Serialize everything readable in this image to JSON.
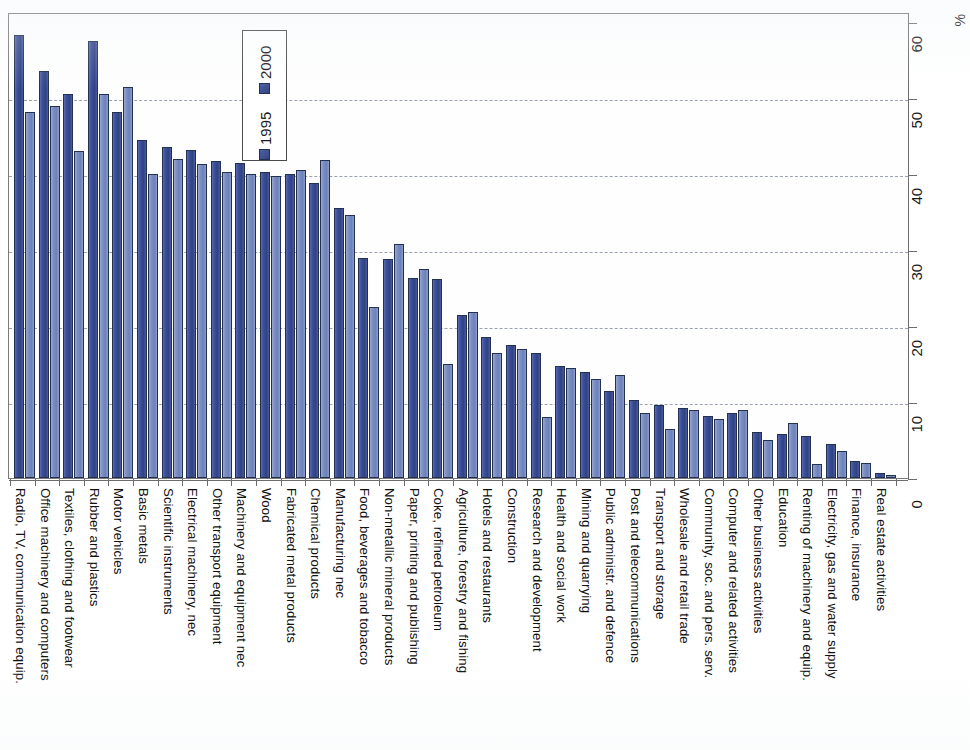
{
  "chart_data": {
    "type": "bar",
    "title": "",
    "xlabel": "",
    "ylabel": "%",
    "ylim": [
      0,
      60
    ],
    "ytick_labels": [
      "0",
      "10",
      "20",
      "30",
      "40",
      "50",
      "60"
    ],
    "ytick_values": [
      0,
      10,
      20,
      30,
      40,
      50,
      60
    ],
    "grid": true,
    "grid_axis": "y",
    "legend_position": "upper-left-inside",
    "orientation": "vertical-bars-rotated-page",
    "colors": {
      "series_1995": "#3b4f9e",
      "series_2000": "#7b8fc4",
      "bar_border": "#23304f",
      "axis": "#6d6d6d",
      "gridline": "#9aa3ae",
      "background": "#ffffff"
    },
    "categories": [
      "Radio, TV, communication equip.",
      "Office machinery and computers",
      "Textiles, clothing and footwear",
      "Rubber and plastics",
      "Motor vehicles",
      "Basic metals",
      "Scientific instruments",
      "Electrical machinery, nec",
      "Other transport equipment",
      "Machinery and equipment nec",
      "Wood",
      "Fabricated metal products",
      "Chemical products",
      "Manufacturing nec",
      "Food, beverages and tobacco",
      "Non-metallic mineral products",
      "Paper, printing and publishing",
      "Coke, refined petroleum",
      "Agriculture, forestry and fishing",
      "Hotels and restaurants",
      "Construction",
      "Research and development",
      "Health and social work",
      "Mining and quarrying",
      "Public administr. and defence",
      "Post and telecommunications",
      "Transport and storage",
      "Wholesale and retail trade",
      "Community, soc. and pers. serv.",
      "Computer and related activities",
      "Other business activities",
      "Education",
      "Renting of machinery and equip.",
      "Electricity, gas and water supply",
      "Finance, insurance",
      "Real estate activities"
    ],
    "series": [
      {
        "name": "1995",
        "color": "#3b4f9e",
        "values": [
          58.3,
          53.5,
          50.5,
          57.5,
          48.2,
          44.5,
          43.5,
          43.2,
          41.7,
          41.5,
          40.2,
          40.0,
          38.8,
          35.5,
          29.0,
          28.8,
          26.3,
          26.2,
          21.5,
          18.5,
          17.5,
          16.5,
          14.8,
          14.0,
          11.5,
          10.2,
          9.6,
          9.2,
          8.2,
          8.5,
          6.0,
          5.8,
          5.5,
          4.5,
          2.2,
          0.6
        ]
      },
      {
        "name": "2000",
        "color": "#7b8fc4",
        "values": [
          48.2,
          49.0,
          43.0,
          50.5,
          51.5,
          40.0,
          42.0,
          41.3,
          40.3,
          40.0,
          39.8,
          40.5,
          41.8,
          34.6,
          22.5,
          30.8,
          27.5,
          15.0,
          21.8,
          16.5,
          17.0,
          8.0,
          14.5,
          13.0,
          13.5,
          8.5,
          6.5,
          9.0,
          7.8,
          9.0,
          5.0,
          7.2,
          1.8,
          3.6,
          2.0,
          0.4
        ]
      }
    ],
    "axis_unit_label": "%"
  },
  "legend": {
    "box_label": "legend",
    "entries": [
      {
        "label": "2000",
        "series": "2000"
      },
      {
        "label": "1995",
        "series": "1995"
      }
    ]
  }
}
